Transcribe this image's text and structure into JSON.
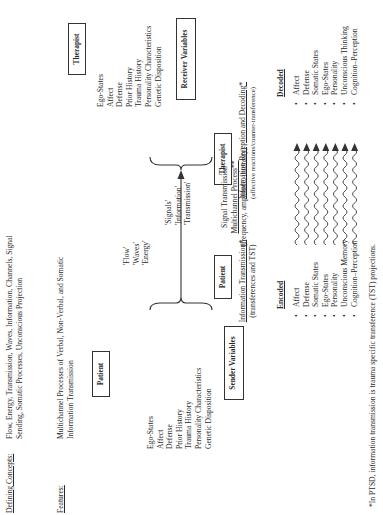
{
  "header": {
    "defining_label": "Defining Concepts:",
    "defining_text": [
      "Flow, Energy, Transmission, Waves, Information, Channels, Signal",
      "Sending, Somatic Processes, Unconscious Projection"
    ],
    "features_label": "Features:",
    "features_text": [
      "Multichannel Processes of Verbal, Non-Verbal, and Somatic",
      "Information Transmission"
    ]
  },
  "sender": {
    "box": "Patient",
    "items": [
      "Ego-States",
      "Affect",
      "Defense",
      "Prior History",
      "Trauma History",
      "Personality Characteristics",
      "Genetic Disposition"
    ],
    "label": "Sender Variables"
  },
  "receiver": {
    "box": "Therapist",
    "items": [
      "Ego-States",
      "Affect",
      "Defense",
      "Prior History",
      "Trauma History",
      "Personality Characteristics",
      "Genetic Disposition"
    ],
    "label": "Receiver Variables"
  },
  "flow_terms": [
    "'Flow'",
    "'Waves'",
    "'Energy'"
  ],
  "signal_terms": [
    "'Signals'",
    "'Information'",
    "'Transmission'"
  ],
  "process": {
    "patient_box": "Patient",
    "therapist_box": "Therapist",
    "info_transmission": "Information Transmission*",
    "info_transmission_sub": "(transferences and TST)",
    "signal_title": "Signal Transmission",
    "signal_process": "Multichannel Process**",
    "signal_sub": "(frequency, amplitude, intensity)",
    "reception": "Information Reception and Decoding*",
    "reception_sub": "(affective reactions/counter-transference)"
  },
  "encoded": {
    "header": "Encoded",
    "items": [
      "Affect",
      "Defense",
      "Somatic States",
      "Ego-States",
      "Personality",
      "Unconscious Memory",
      "Cognition–Perception"
    ]
  },
  "decoded": {
    "header": "Decoded",
    "items": [
      "Affect",
      "Defense",
      "Somatic States",
      "Ego-States",
      "Personality",
      "Unconscious Thinking",
      "Cognition–Perception"
    ]
  },
  "footnote": "*In PTSD, information transmission is trauma specific transference (TST) projections."
}
